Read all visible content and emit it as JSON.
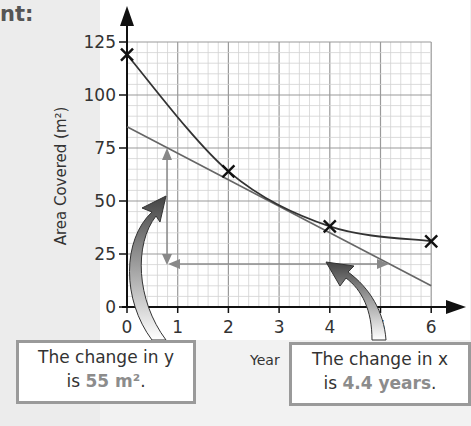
{
  "page": {
    "heading_fragment": "nt:"
  },
  "chart_data": {
    "type": "line",
    "title": "",
    "xlabel": "Year",
    "ylabel": "Area Covered (m²)",
    "xlim": [
      0,
      6
    ],
    "ylim": [
      0,
      125
    ],
    "x_ticks": [
      "0",
      "1",
      "2",
      "3",
      "4",
      "5",
      "6"
    ],
    "y_ticks": [
      "0",
      "25",
      "50",
      "75",
      "100",
      "125"
    ],
    "grid": true,
    "series": [
      {
        "name": "Area covered (measured points, curve of best fit)",
        "x": [
          0,
          2,
          4,
          6
        ],
        "y": [
          119,
          64,
          38,
          31
        ],
        "marker": "x"
      },
      {
        "name": "Tangent at x = 3",
        "x": [
          0,
          6
        ],
        "y": [
          85,
          10
        ],
        "style": "line"
      }
    ],
    "annotations": [
      {
        "type": "vertical-measure",
        "x": 0.8,
        "y_from": 25,
        "y_to": 80,
        "label": "The change in y is 55 m²."
      },
      {
        "type": "horizontal-measure",
        "y": 21,
        "x_from": 0.8,
        "x_to": 5.2,
        "label": "The change in x is 4.4 years."
      }
    ]
  },
  "callouts": {
    "y_change": {
      "line1": "The change in y",
      "prefix": "is ",
      "value": "55 m²",
      "suffix": "."
    },
    "x_change": {
      "line1": "The change in x",
      "prefix": "is ",
      "value": "4.4 years",
      "suffix": "."
    }
  },
  "colors": {
    "curve": "#333333",
    "tangent": "#666666",
    "measure": "#888888",
    "grid_major": "#9a9a9a",
    "grid_minor": "#cfcfcf",
    "highlight_text": "#8c8c8c"
  }
}
